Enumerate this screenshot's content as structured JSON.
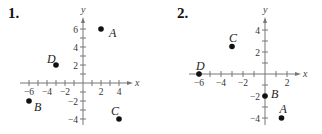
{
  "chart_data": [
    {
      "type": "scatter",
      "label": "1.",
      "xlabel": "x",
      "ylabel": "y",
      "x_ticks": [
        -6,
        -4,
        -2,
        2,
        4
      ],
      "y_ticks": [
        6,
        4,
        2,
        -2,
        -4
      ],
      "xlim": [
        -7,
        5
      ],
      "ylim": [
        -4.5,
        7
      ],
      "grid": false,
      "points": [
        {
          "name": "A",
          "x": 2,
          "y": 6
        },
        {
          "name": "B",
          "x": -6,
          "y": -2
        },
        {
          "name": "C",
          "x": 4,
          "y": -4
        },
        {
          "name": "D",
          "x": -3,
          "y": 2
        }
      ]
    },
    {
      "type": "scatter",
      "label": "2.",
      "xlabel": "x",
      "ylabel": "y",
      "x_ticks": [
        -6,
        -4,
        -2,
        2
      ],
      "y_ticks": [
        4,
        2,
        -2,
        -4
      ],
      "xlim": [
        -7,
        3
      ],
      "ylim": [
        -4.5,
        5
      ],
      "grid": false,
      "points": [
        {
          "name": "A",
          "x": 1.5,
          "y": -4
        },
        {
          "name": "B",
          "x": 0,
          "y": -2
        },
        {
          "name": "C",
          "x": -3,
          "y": 2.5
        },
        {
          "name": "D",
          "x": -6,
          "y": 0
        }
      ]
    }
  ]
}
